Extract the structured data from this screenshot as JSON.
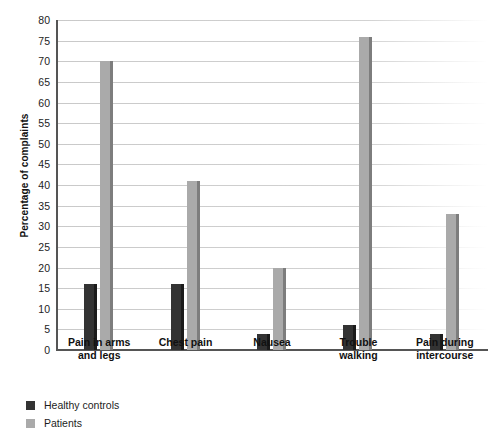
{
  "chart_data": {
    "type": "bar",
    "title": "",
    "xlabel": "",
    "ylabel": "Percentage of complaints",
    "ylim": [
      0,
      80
    ],
    "ytick_step": 5,
    "yticks": [
      0,
      5,
      10,
      15,
      20,
      25,
      30,
      35,
      40,
      45,
      50,
      55,
      60,
      65,
      70,
      75,
      80
    ],
    "grid": true,
    "legend_position": "below-left",
    "categories": [
      "Pain in arms and legs",
      "Chest pain",
      "Nausea",
      "Trouble walking",
      "Pain during intercourse"
    ],
    "category_lines": [
      [
        "Pain in arms",
        "and legs"
      ],
      [
        "Chest pain"
      ],
      [
        "Nausea"
      ],
      [
        "Trouble",
        "walking"
      ],
      [
        "Pain during",
        "intercourse"
      ]
    ],
    "series": [
      {
        "name": "Healthy controls",
        "color": "#333333",
        "values": [
          16,
          16,
          4,
          6,
          4
        ]
      },
      {
        "name": "Patients",
        "color": "#aaaaaa",
        "values": [
          70,
          41,
          20,
          76,
          33
        ]
      }
    ]
  }
}
